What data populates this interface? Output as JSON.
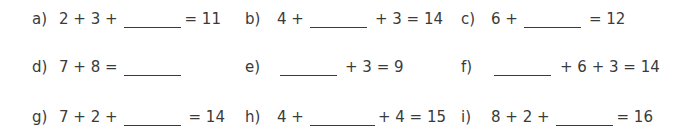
{
  "worksheet": {
    "problems": [
      {
        "label": "a)",
        "before": "2 + 3 +",
        "after": "= 11"
      },
      {
        "label": "b)",
        "before": "4 +",
        "after": "+ 3 = 14"
      },
      {
        "label": "c)",
        "before": "6 +",
        "after": "= 12"
      },
      {
        "label": "d)",
        "before": "7 + 8 =",
        "after": ""
      },
      {
        "label": "e)",
        "before": "",
        "after": "+ 3 = 9"
      },
      {
        "label": "f)",
        "before": "",
        "after": "+ 6 + 3 = 14"
      },
      {
        "label": "g)",
        "before": "7 + 2 +",
        "after": "= 14"
      },
      {
        "label": "h)",
        "before": "4 +",
        "after": "+ 4 = 15"
      },
      {
        "label": "i)",
        "before": "8 + 2 +",
        "after": "= 16"
      }
    ]
  }
}
